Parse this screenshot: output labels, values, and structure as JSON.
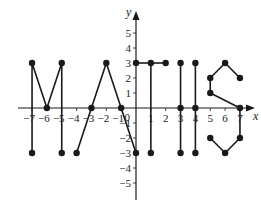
{
  "chart_data": {
    "type": "line",
    "title": "",
    "subtitle": "",
    "xlabel": "x",
    "ylabel": "y",
    "xlim": [
      -8,
      8
    ],
    "ylim": [
      -5.5,
      5.5
    ],
    "grid": false,
    "legend": null,
    "x_ticks": [
      -7,
      -6,
      -5,
      -4,
      -3,
      -2,
      -1,
      0,
      1,
      2,
      3,
      4,
      5,
      6,
      7
    ],
    "x_tick_labels": [
      "-7",
      "-6",
      "-5",
      "-4",
      "-3",
      "-2",
      "-1",
      "0",
      "1",
      "2",
      "3",
      "4",
      "5",
      "6",
      "7"
    ],
    "y_ticks": [
      -5,
      -4,
      -3,
      -2,
      -1,
      1,
      2,
      3,
      4,
      5
    ],
    "y_tick_labels": [
      "-5",
      "-4",
      "-3",
      "-2",
      "-1",
      "1",
      "2",
      "3",
      "4",
      "5"
    ],
    "annotation": "Points joined to spell MATHS",
    "series": [
      {
        "name": "M",
        "polylines": [
          [
            [
              -7,
              -3
            ],
            [
              -7,
              3
            ],
            [
              -6,
              0
            ],
            [
              -5,
              3
            ],
            [
              -5,
              -3
            ]
          ]
        ],
        "points": [
          [
            -7,
            -3
          ],
          [
            -7,
            3
          ],
          [
            -6,
            0
          ],
          [
            -5,
            3
          ],
          [
            -5,
            -3
          ]
        ]
      },
      {
        "name": "A",
        "polylines": [
          [
            [
              -4,
              -3
            ],
            [
              -2,
              3
            ],
            [
              0,
              -3
            ]
          ]
        ],
        "points": [
          [
            -4,
            -3
          ],
          [
            -3,
            0
          ],
          [
            -2,
            3
          ],
          [
            -1,
            0
          ],
          [
            0,
            -3
          ]
        ]
      },
      {
        "name": "T",
        "polylines": [
          [
            [
              0,
              3
            ],
            [
              2,
              3
            ]
          ],
          [
            [
              1,
              3
            ],
            [
              1,
              -3
            ]
          ]
        ],
        "points": [
          [
            0,
            3
          ],
          [
            1,
            3
          ],
          [
            2,
            3
          ],
          [
            1,
            -3
          ]
        ]
      },
      {
        "name": "H",
        "polylines": [
          [
            [
              3,
              3
            ],
            [
              3,
              -3
            ]
          ],
          [
            [
              4,
              3
            ],
            [
              4,
              -3
            ]
          ]
        ],
        "points": [
          [
            3,
            3
          ],
          [
            3,
            0
          ],
          [
            3,
            -3
          ],
          [
            4,
            3
          ],
          [
            4,
            0
          ],
          [
            4,
            -3
          ]
        ]
      },
      {
        "name": "S",
        "polylines": [
          [
            [
              7,
              2
            ],
            [
              6,
              3
            ],
            [
              5,
              2
            ],
            [
              5,
              1
            ],
            [
              7,
              0
            ],
            [
              7,
              -2
            ],
            [
              6,
              -3
            ],
            [
              5,
              -2
            ]
          ]
        ],
        "points": [
          [
            7,
            2
          ],
          [
            6,
            3
          ],
          [
            5,
            2
          ],
          [
            5,
            1
          ],
          [
            7,
            0
          ],
          [
            7,
            -2
          ],
          [
            6,
            -3
          ],
          [
            5,
            -2
          ]
        ]
      }
    ]
  },
  "labels": {
    "x_axis": "x",
    "y_axis": "y",
    "origin": "0"
  }
}
